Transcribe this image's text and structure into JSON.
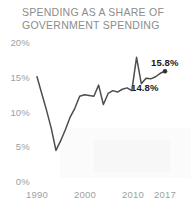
{
  "chart_data": {
    "type": "line",
    "title": "SPENDING AS A SHARE OF\nGOVERNMENT SPENDING",
    "title_line1": "SPENDING AS A SHARE OF",
    "title_line2": "GOVERNMENT SPENDING",
    "xlabel": "",
    "ylabel": "",
    "xlim": [
      1989,
      2018
    ],
    "ylim": [
      0,
      20
    ],
    "grid": false,
    "legend": null,
    "y_ticks": [
      "0%",
      "5%",
      "10%",
      "15%",
      "20%"
    ],
    "y_tick_values": [
      0,
      5,
      10,
      15,
      20
    ],
    "x_ticks": [
      "1990",
      "2000",
      "2010",
      "2017"
    ],
    "x_tick_values": [
      1990,
      2000,
      2010,
      2017
    ],
    "line_color": "#4d4d4d",
    "marker_color": "#333333",
    "label_color": "#1a1a1a",
    "axis_color": "#a0a0a0",
    "title_color": "#8c8c8c",
    "x": [
      1990,
      1991,
      1992,
      1993,
      1994,
      1995,
      1996,
      1997,
      1998,
      1999,
      2000,
      2001,
      2002,
      2003,
      2004,
      2005,
      2006,
      2007,
      2008,
      2009,
      2010,
      2011,
      2012,
      2013,
      2014,
      2015,
      2016,
      2017
    ],
    "values": [
      15.0,
      12.6,
      10.2,
      7.6,
      4.4,
      5.8,
      7.4,
      9.2,
      10.5,
      12.2,
      12.4,
      12.3,
      12.2,
      13.8,
      11.0,
      12.6,
      13.0,
      12.8,
      13.2,
      13.4,
      13.0,
      17.8,
      14.0,
      14.8,
      14.7,
      15.0,
      15.5,
      15.8
    ],
    "annotations": [
      {
        "text": "15.8%",
        "value": 15.8,
        "year": 2017
      },
      {
        "text": "14.8%",
        "value": 14.8,
        "year": 2013
      }
    ],
    "end_marker": {
      "year": 2017,
      "value": 15.8
    }
  },
  "labels": {
    "y0": "0%",
    "y5": "5%",
    "y10": "10%",
    "y15": "15%",
    "y20": "20%",
    "x1990": "1990",
    "x2000": "2000",
    "x2010": "2010",
    "x2017": "2017",
    "ann_high": "15.8%",
    "ann_low": "14.8%"
  }
}
